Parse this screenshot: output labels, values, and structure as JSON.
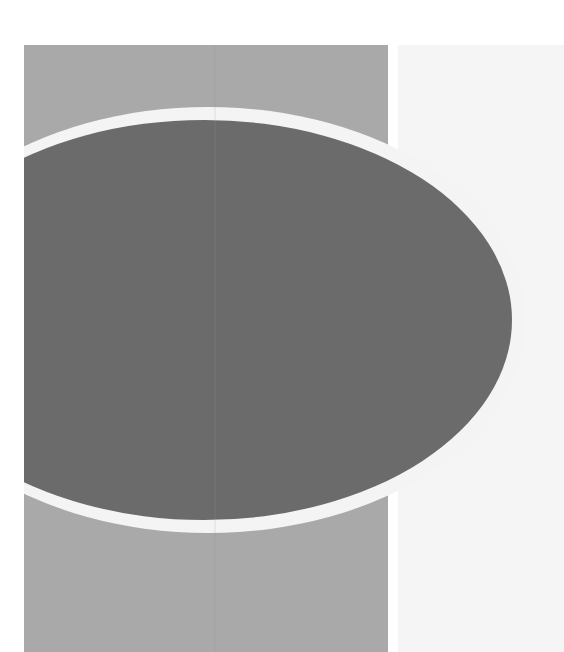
{
  "artwork": {
    "description": "Abstract grayscale cover graphic",
    "colors": {
      "background": "#ffffff",
      "right_panel": "#f5f5f5",
      "rectangle": "#a9a9a9",
      "ring": "#f4f4f4",
      "ellipse": "#6b6b6b"
    },
    "shapes": {
      "rectangle": {
        "x": 24,
        "y": 45,
        "width": 364,
        "height": 607
      },
      "right_panel": {
        "x": 398,
        "y": 45,
        "width": 166,
        "height": 607
      },
      "ring": {
        "cx": 208,
        "cy": 320,
        "rx": 318,
        "ry": 213
      },
      "ellipse": {
        "cx": 204,
        "cy": 320,
        "rx": 308,
        "ry": 200
      }
    }
  }
}
